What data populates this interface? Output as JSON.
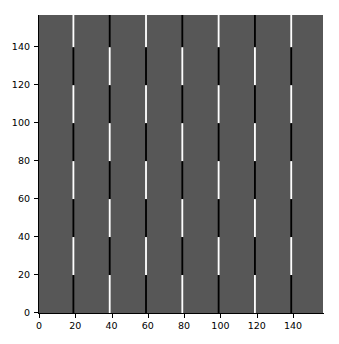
{
  "figure": {
    "background_color": "#ffffff",
    "width": 339,
    "height": 344
  },
  "axes": {
    "background_color": "#575757",
    "spine_color": "#000000",
    "tick_color": "#000000",
    "ticklabel_color": "#000000"
  },
  "xaxis": {
    "label": "",
    "ticks": [
      0,
      20,
      40,
      60,
      80,
      100,
      120,
      140
    ],
    "ticklabels": [
      "0",
      "20",
      "40",
      "60",
      "80",
      "100",
      "120",
      "140"
    ],
    "limits": [
      -0.5,
      156.5
    ]
  },
  "yaxis": {
    "label": "",
    "ticks": [
      0,
      20,
      40,
      60,
      80,
      100,
      120,
      140
    ],
    "ticklabels": [
      "0",
      "20",
      "40",
      "60",
      "80",
      "100",
      "120",
      "140"
    ],
    "limits": [
      -0.5,
      156.5
    ]
  },
  "chart_data": {
    "type": "heatmap",
    "title": "",
    "subtitle": "",
    "xlabel": "",
    "ylabel": "",
    "xlim": [
      -0.5,
      156.5
    ],
    "ylim": [
      -0.5,
      156.5
    ],
    "grid": false,
    "legend": null,
    "colormap": "gray",
    "value_colors": {
      "background": "#575757",
      "low": "#000000",
      "high": "#ffffff"
    },
    "stripe_x_positions": [
      19,
      39,
      59,
      79,
      99,
      119,
      139
    ],
    "segment_height": 20,
    "segment_boundaries": [
      0,
      20,
      40,
      60,
      80,
      100,
      120,
      140,
      157
    ],
    "stripes": [
      {
        "x": 19,
        "phase": "white-top",
        "segments": [
          {
            "y_from": 140,
            "y_to": 157,
            "color": "#ffffff"
          },
          {
            "y_from": 120,
            "y_to": 140,
            "color": "#000000"
          },
          {
            "y_from": 100,
            "y_to": 120,
            "color": "#ffffff"
          },
          {
            "y_from": 80,
            "y_to": 100,
            "color": "#000000"
          },
          {
            "y_from": 60,
            "y_to": 80,
            "color": "#ffffff"
          },
          {
            "y_from": 40,
            "y_to": 60,
            "color": "#000000"
          },
          {
            "y_from": 20,
            "y_to": 40,
            "color": "#ffffff"
          },
          {
            "y_from": 0,
            "y_to": 20,
            "color": "#000000"
          }
        ]
      },
      {
        "x": 39,
        "phase": "black-top",
        "segments": [
          {
            "y_from": 140,
            "y_to": 157,
            "color": "#000000"
          },
          {
            "y_from": 120,
            "y_to": 140,
            "color": "#ffffff"
          },
          {
            "y_from": 100,
            "y_to": 120,
            "color": "#000000"
          },
          {
            "y_from": 80,
            "y_to": 100,
            "color": "#ffffff"
          },
          {
            "y_from": 60,
            "y_to": 80,
            "color": "#000000"
          },
          {
            "y_from": 40,
            "y_to": 60,
            "color": "#ffffff"
          },
          {
            "y_from": 20,
            "y_to": 40,
            "color": "#000000"
          },
          {
            "y_from": 0,
            "y_to": 20,
            "color": "#ffffff"
          }
        ]
      },
      {
        "x": 59,
        "phase": "white-top",
        "segments": [
          {
            "y_from": 140,
            "y_to": 157,
            "color": "#ffffff"
          },
          {
            "y_from": 120,
            "y_to": 140,
            "color": "#000000"
          },
          {
            "y_from": 100,
            "y_to": 120,
            "color": "#ffffff"
          },
          {
            "y_from": 80,
            "y_to": 100,
            "color": "#000000"
          },
          {
            "y_from": 60,
            "y_to": 80,
            "color": "#ffffff"
          },
          {
            "y_from": 40,
            "y_to": 60,
            "color": "#000000"
          },
          {
            "y_from": 20,
            "y_to": 40,
            "color": "#ffffff"
          },
          {
            "y_from": 0,
            "y_to": 20,
            "color": "#000000"
          }
        ]
      },
      {
        "x": 79,
        "phase": "black-top",
        "segments": [
          {
            "y_from": 140,
            "y_to": 157,
            "color": "#000000"
          },
          {
            "y_from": 120,
            "y_to": 140,
            "color": "#ffffff"
          },
          {
            "y_from": 100,
            "y_to": 120,
            "color": "#000000"
          },
          {
            "y_from": 80,
            "y_to": 100,
            "color": "#ffffff"
          },
          {
            "y_from": 60,
            "y_to": 80,
            "color": "#000000"
          },
          {
            "y_from": 40,
            "y_to": 60,
            "color": "#ffffff"
          },
          {
            "y_from": 20,
            "y_to": 40,
            "color": "#000000"
          },
          {
            "y_from": 0,
            "y_to": 20,
            "color": "#ffffff"
          }
        ]
      },
      {
        "x": 99,
        "phase": "white-top",
        "segments": [
          {
            "y_from": 140,
            "y_to": 157,
            "color": "#ffffff"
          },
          {
            "y_from": 120,
            "y_to": 140,
            "color": "#000000"
          },
          {
            "y_from": 100,
            "y_to": 120,
            "color": "#ffffff"
          },
          {
            "y_from": 80,
            "y_to": 100,
            "color": "#000000"
          },
          {
            "y_from": 60,
            "y_to": 80,
            "color": "#ffffff"
          },
          {
            "y_from": 40,
            "y_to": 60,
            "color": "#000000"
          },
          {
            "y_from": 20,
            "y_to": 40,
            "color": "#ffffff"
          },
          {
            "y_from": 0,
            "y_to": 20,
            "color": "#000000"
          }
        ]
      },
      {
        "x": 119,
        "phase": "black-top",
        "segments": [
          {
            "y_from": 140,
            "y_to": 157,
            "color": "#000000"
          },
          {
            "y_from": 120,
            "y_to": 140,
            "color": "#ffffff"
          },
          {
            "y_from": 100,
            "y_to": 120,
            "color": "#000000"
          },
          {
            "y_from": 80,
            "y_to": 100,
            "color": "#ffffff"
          },
          {
            "y_from": 60,
            "y_to": 80,
            "color": "#000000"
          },
          {
            "y_from": 40,
            "y_to": 60,
            "color": "#ffffff"
          },
          {
            "y_from": 20,
            "y_to": 40,
            "color": "#000000"
          },
          {
            "y_from": 0,
            "y_to": 20,
            "color": "#ffffff"
          }
        ]
      },
      {
        "x": 139,
        "phase": "white-top",
        "segments": [
          {
            "y_from": 140,
            "y_to": 157,
            "color": "#ffffff"
          },
          {
            "y_from": 120,
            "y_to": 140,
            "color": "#000000"
          },
          {
            "y_from": 100,
            "y_to": 120,
            "color": "#ffffff"
          },
          {
            "y_from": 80,
            "y_to": 100,
            "color": "#000000"
          },
          {
            "y_from": 60,
            "y_to": 80,
            "color": "#ffffff"
          },
          {
            "y_from": 40,
            "y_to": 60,
            "color": "#000000"
          },
          {
            "y_from": 20,
            "y_to": 40,
            "color": "#ffffff"
          },
          {
            "y_from": 0,
            "y_to": 20,
            "color": "#000000"
          }
        ]
      }
    ]
  }
}
